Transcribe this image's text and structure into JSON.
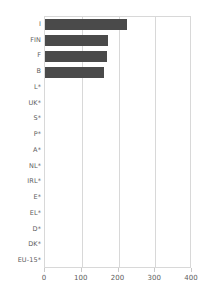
{
  "chart_data": {
    "type": "bar",
    "orientation": "horizontal",
    "title": "",
    "subtitle": "",
    "xlabel": "",
    "ylabel": "",
    "categories": [
      "I",
      "FIN",
      "F",
      "B",
      "L*",
      "UK*",
      "S*",
      "P*",
      "A*",
      "NL*",
      "IRL*",
      "E*",
      "EL*",
      "D*",
      "DK*",
      "EU-15*"
    ],
    "values": [
      222,
      172,
      170,
      160,
      0,
      0,
      0,
      0,
      0,
      0,
      0,
      0,
      0,
      0,
      0,
      0
    ],
    "xlim": [
      0,
      400
    ],
    "xticks": [
      0,
      100,
      200,
      300,
      400
    ],
    "xtick_labels": [
      "0",
      "100",
      "200",
      "300",
      "400"
    ],
    "gridlines": [
      100,
      200,
      300
    ],
    "grid": true,
    "legend": null,
    "bar_color": "#4a4a4a",
    "frame_color": "#d8d8d8",
    "tick_label_color": "#5c5c5c"
  }
}
